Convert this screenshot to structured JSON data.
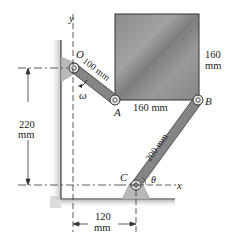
{
  "figure": {
    "type": "mechanism-diagram",
    "points": {
      "O": "O",
      "A": "A",
      "B": "B",
      "C": "C"
    },
    "axes": {
      "x": "x",
      "y": "y"
    },
    "symbols": {
      "omega": "ω",
      "theta": "θ"
    },
    "dimensions": {
      "link_OA": "100 mm",
      "plate_width": "160 mm",
      "plate_height_value": "160",
      "plate_height_unit": "mm",
      "link_BC": "200 mm",
      "vertical_offset_value": "220",
      "vertical_offset_unit": "mm",
      "horizontal_offset_value": "120",
      "horizontal_offset_unit": "mm"
    },
    "colors": {
      "plate": "#8a8a8a",
      "link": "#7f7f7f",
      "support": "#b5b5b5",
      "wall_shadow": "#c8c8c8",
      "line": "#222222"
    }
  }
}
